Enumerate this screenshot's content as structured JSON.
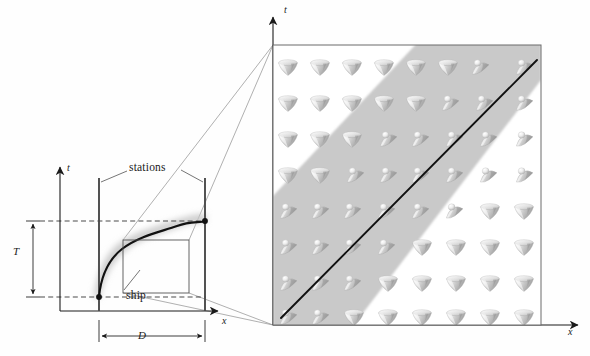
{
  "figure": {
    "type": "spacetime-diagram"
  },
  "left_panel": {
    "name": "overview-spacetime-diagram",
    "axes": {
      "t_axis_label": "t",
      "x_axis_label": "x",
      "t_axis": {
        "x": 60,
        "y_top": 164,
        "y_bottom": 311
      },
      "x_axis": {
        "y": 311,
        "x_left": 60,
        "x_right": 222
      }
    },
    "annotations": {
      "stations_label": "stations",
      "ship_label": "ship",
      "duration_label": "T",
      "distance_label": "D"
    },
    "stations": [
      {
        "name": "station-left",
        "x": 99,
        "y_top": 178,
        "y_bottom": 311
      },
      {
        "name": "station-right",
        "x": 205,
        "y_top": 178,
        "y_bottom": 311
      }
    ],
    "events": [
      {
        "name": "departure-event",
        "x": 99,
        "y": 297
      },
      {
        "name": "arrival-event",
        "x": 205,
        "y": 221
      }
    ],
    "guide_lines": [
      {
        "name": "departure-dashed-line",
        "x1": 40,
        "y1": 297,
        "x2": 205,
        "y2": 297
      },
      {
        "name": "arrival-dashed-line",
        "x1": 40,
        "y1": 221,
        "x2": 205,
        "y2": 221
      }
    ],
    "T_bracket": {
      "x": 33,
      "y_top": 221,
      "y_bottom": 297
    },
    "D_bracket": {
      "y": 336,
      "x_left": 99,
      "x_right": 205
    },
    "worldline_path": "M 99,297 C 102,272 110,258 124,247 C 140,235 160,231 176,225 C 190,220 199,222 205,221",
    "wake_band_note": "soft grey blurred band following the worldline",
    "magnifier_box": {
      "x": 123,
      "y": 240,
      "width": 66,
      "height": 53
    },
    "leader_lines": [
      {
        "name": "magnifier-leader-top",
        "from": [
          189,
          240
        ],
        "to": [
          273,
          45
        ]
      },
      {
        "name": "magnifier-leader-top-inner",
        "from": [
          123,
          240
        ],
        "to": [
          273,
          45
        ]
      },
      {
        "name": "magnifier-leader-bottom",
        "from": [
          189,
          293
        ],
        "to": [
          273,
          325
        ]
      },
      {
        "name": "magnifier-leader-bottom-inner",
        "from": [
          123,
          293
        ],
        "to": [
          273,
          325
        ]
      }
    ],
    "stations_leaders": [
      {
        "from": [
          128,
          172
        ],
        "to": [
          103,
          182
        ]
      },
      {
        "from": [
          183,
          172
        ],
        "to": [
          203,
          182
        ]
      }
    ],
    "ship_leader": {
      "from": [
        124,
        291
      ],
      "to": [
        140,
        271
      ]
    }
  },
  "right_panel": {
    "name": "magnified-lightcone-field",
    "axes": {
      "t_axis_label": "t",
      "x_axis_label": "x",
      "t_axis": {
        "x": 273,
        "y_top": 14,
        "y_bottom": 325
      },
      "x_axis": {
        "y": 325,
        "x_left": 273,
        "x_right": 583
      }
    },
    "frame": {
      "x": 273,
      "y": 45,
      "width": 268,
      "height": 280
    },
    "grid": {
      "columns": 8,
      "rows": 8
    },
    "shaded_band": {
      "name": "tilted-cone-band",
      "note": "diagonal grey band running lower-left to upper-right at about 45 degrees; light cones inside are tipped over toward +x"
    },
    "worldline": {
      "name": "ship-worldline-magnified",
      "from": [
        283,
        317
      ],
      "to": [
        537,
        60
      ]
    },
    "cone_states": {
      "upright": "inverted cone pointing down (untilted light cone)",
      "tilted": "cone tipped over to the right (light cone tilted by the ship's drive)"
    }
  },
  "colors": {
    "ink": "#1a1a1a",
    "axis": "#3a3a3a",
    "station_line": "#555555",
    "band_grey": "#c9c9c9",
    "cone_light": "#f2f2f2",
    "cone_mid": "#cfcfcf",
    "cone_dark": "#9a9a9a",
    "leader": "#8a8a8a",
    "background": "#ffffff"
  }
}
